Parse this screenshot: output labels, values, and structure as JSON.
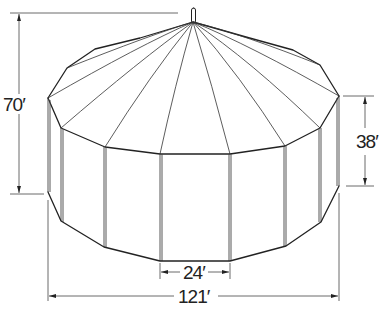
{
  "figure": {
    "line_color": "#222222",
    "background": "#ffffff"
  },
  "dimensions": {
    "total_height": {
      "label": "70′",
      "value_ft": 70
    },
    "wall_height": {
      "label": "38′",
      "value_ft": 38
    },
    "panel_width": {
      "label": "24′",
      "value_ft": 24
    },
    "diameter": {
      "label": "121′",
      "value_ft": 121
    }
  }
}
